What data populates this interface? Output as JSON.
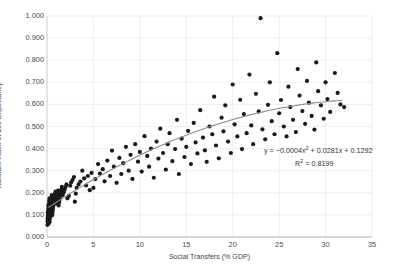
{
  "chart_data": {
    "type": "scatter",
    "title": "",
    "xlabel": "Social Transfers (% GDP)",
    "ylabel": "Kakwani Index of Life Expectancy",
    "xlim": [
      0,
      35
    ],
    "ylim": [
      0.0,
      1.0
    ],
    "xticks": [
      "0",
      "5",
      "10",
      "15",
      "20",
      "25",
      "30",
      "35"
    ],
    "xtick_values": [
      0,
      5,
      10,
      15,
      20,
      25,
      30,
      35
    ],
    "yticks": [
      "0.000",
      "0.100",
      "0.200",
      "0.300",
      "0.400",
      "0.500",
      "0.600",
      "0.700",
      "0.800",
      "0.900",
      "1.000"
    ],
    "ytick_values": [
      0.0,
      0.1,
      0.2,
      0.3,
      0.4,
      0.5,
      0.6,
      0.7,
      0.8,
      0.9,
      1.0
    ],
    "grid": true,
    "grid_color": "#e8e8e8",
    "legend": "none",
    "marker_color": "#1a1a1a",
    "marker_size": 2.1,
    "trendline": {
      "type": "polynomial",
      "degree": 2,
      "color": "#8c8c8c",
      "coefficients": [
        -0.0004,
        0.0281,
        0.1292
      ],
      "x_start": 0.15,
      "x_end": 31.8
    },
    "annotations": [
      {
        "name": "equation",
        "text": "y = −0.0004x² + 0.0281x + 0.1292"
      },
      {
        "name": "r-squared",
        "text": "R² = 0.8199"
      }
    ],
    "equation_parts": {
      "prefix": "y = −0.0004x",
      "exp": "2",
      "suffix": " + 0.0281x + 0.1292",
      "r2_prefix": "R",
      "r2_exp": "2",
      "r2_suffix": " = 0.8199"
    },
    "points": [
      [
        0.05,
        0.055
      ],
      [
        0.06,
        0.071
      ],
      [
        0.07,
        0.083
      ],
      [
        0.08,
        0.095
      ],
      [
        0.09,
        0.104
      ],
      [
        0.1,
        0.112
      ],
      [
        0.11,
        0.063
      ],
      [
        0.12,
        0.077
      ],
      [
        0.13,
        0.09
      ],
      [
        0.14,
        0.12
      ],
      [
        0.15,
        0.131
      ],
      [
        0.16,
        0.144
      ],
      [
        0.17,
        0.06
      ],
      [
        0.18,
        0.086
      ],
      [
        0.19,
        0.099
      ],
      [
        0.2,
        0.107
      ],
      [
        0.21,
        0.117
      ],
      [
        0.22,
        0.126
      ],
      [
        0.23,
        0.135
      ],
      [
        0.24,
        0.15
      ],
      [
        0.25,
        0.158
      ],
      [
        0.26,
        0.166
      ],
      [
        0.27,
        0.175
      ],
      [
        0.28,
        0.068
      ],
      [
        0.3,
        0.081
      ],
      [
        0.32,
        0.092
      ],
      [
        0.34,
        0.101
      ],
      [
        0.36,
        0.11
      ],
      [
        0.38,
        0.122
      ],
      [
        0.4,
        0.133
      ],
      [
        0.42,
        0.141
      ],
      [
        0.44,
        0.153
      ],
      [
        0.46,
        0.163
      ],
      [
        0.48,
        0.172
      ],
      [
        0.5,
        0.181
      ],
      [
        0.52,
        0.19
      ],
      [
        0.55,
        0.098
      ],
      [
        0.58,
        0.108
      ],
      [
        0.6,
        0.119
      ],
      [
        0.63,
        0.128
      ],
      [
        0.66,
        0.138
      ],
      [
        0.7,
        0.147
      ],
      [
        0.73,
        0.157
      ],
      [
        0.76,
        0.168
      ],
      [
        0.8,
        0.178
      ],
      [
        0.84,
        0.188
      ],
      [
        0.88,
        0.196
      ],
      [
        0.92,
        0.205
      ],
      [
        0.96,
        0.152
      ],
      [
        1.0,
        0.163
      ],
      [
        1.05,
        0.174
      ],
      [
        1.1,
        0.186
      ],
      [
        1.15,
        0.198
      ],
      [
        1.2,
        0.21
      ],
      [
        1.25,
        0.143
      ],
      [
        1.3,
        0.156
      ],
      [
        1.35,
        0.168
      ],
      [
        1.4,
        0.181
      ],
      [
        1.45,
        0.193
      ],
      [
        1.5,
        0.205
      ],
      [
        1.55,
        0.216
      ],
      [
        1.6,
        0.227
      ],
      [
        1.7,
        0.19
      ],
      [
        1.8,
        0.202
      ],
      [
        1.9,
        0.214
      ],
      [
        2.0,
        0.226
      ],
      [
        2.1,
        0.238
      ],
      [
        2.2,
        0.175
      ],
      [
        2.35,
        0.186
      ],
      [
        2.5,
        0.232
      ],
      [
        2.6,
        0.247
      ],
      [
        2.75,
        0.258
      ],
      [
        2.9,
        0.271
      ],
      [
        3.0,
        0.16
      ],
      [
        3.1,
        0.196
      ],
      [
        3.2,
        0.222
      ],
      [
        3.4,
        0.238
      ],
      [
        3.6,
        0.251
      ],
      [
        3.8,
        0.3
      ],
      [
        4.0,
        0.265
      ],
      [
        4.2,
        0.233
      ],
      [
        4.4,
        0.276
      ],
      [
        4.6,
        0.212
      ],
      [
        4.8,
        0.29
      ],
      [
        5.0,
        0.222
      ],
      [
        5.2,
        0.262
      ],
      [
        5.5,
        0.33
      ],
      [
        5.7,
        0.287
      ],
      [
        6.0,
        0.307
      ],
      [
        6.2,
        0.252
      ],
      [
        6.5,
        0.346
      ],
      [
        6.8,
        0.276
      ],
      [
        7.0,
        0.391
      ],
      [
        7.2,
        0.318
      ],
      [
        7.5,
        0.245
      ],
      [
        7.8,
        0.358
      ],
      [
        8.0,
        0.285
      ],
      [
        8.2,
        0.334
      ],
      [
        8.5,
        0.408
      ],
      [
        8.8,
        0.3
      ],
      [
        9.0,
        0.372
      ],
      [
        9.2,
        0.263
      ],
      [
        9.5,
        0.42
      ],
      [
        9.8,
        0.341
      ],
      [
        10.0,
        0.385
      ],
      [
        10.2,
        0.296
      ],
      [
        10.5,
        0.456
      ],
      [
        10.8,
        0.367
      ],
      [
        11.0,
        0.318
      ],
      [
        11.2,
        0.4
      ],
      [
        11.5,
        0.268
      ],
      [
        11.8,
        0.432
      ],
      [
        12.0,
        0.355
      ],
      [
        12.2,
        0.49
      ],
      [
        12.5,
        0.38
      ],
      [
        12.8,
        0.305
      ],
      [
        13.0,
        0.42
      ],
      [
        13.2,
        0.47
      ],
      [
        13.5,
        0.343
      ],
      [
        13.8,
        0.398
      ],
      [
        14.0,
        0.53
      ],
      [
        14.2,
        0.285
      ],
      [
        14.5,
        0.445
      ],
      [
        14.8,
        0.362
      ],
      [
        15.0,
        0.408
      ],
      [
        15.2,
        0.48
      ],
      [
        15.5,
        0.33
      ],
      [
        15.8,
        0.516
      ],
      [
        16.0,
        0.428
      ],
      [
        16.2,
        0.378
      ],
      [
        16.5,
        0.574
      ],
      [
        16.8,
        0.45
      ],
      [
        17.0,
        0.392
      ],
      [
        17.2,
        0.34
      ],
      [
        17.5,
        0.5
      ],
      [
        17.8,
        0.465
      ],
      [
        18.0,
        0.635
      ],
      [
        18.2,
        0.414
      ],
      [
        18.5,
        0.356
      ],
      [
        18.8,
        0.54
      ],
      [
        19.0,
        0.478
      ],
      [
        19.2,
        0.596
      ],
      [
        19.5,
        0.432
      ],
      [
        19.8,
        0.38
      ],
      [
        20.0,
        0.69
      ],
      [
        20.2,
        0.51
      ],
      [
        20.5,
        0.455
      ],
      [
        20.8,
        0.621
      ],
      [
        21.0,
        0.398
      ],
      [
        21.2,
        0.556
      ],
      [
        21.5,
        0.47
      ],
      [
        21.8,
        0.735
      ],
      [
        22.0,
        0.505
      ],
      [
        22.2,
        0.42
      ],
      [
        22.5,
        0.648
      ],
      [
        22.8,
        0.568
      ],
      [
        23.0,
        0.99
      ],
      [
        23.2,
        0.487
      ],
      [
        23.5,
        0.442
      ],
      [
        23.8,
        0.598
      ],
      [
        24.0,
        0.7
      ],
      [
        24.2,
        0.524
      ],
      [
        24.5,
        0.465
      ],
      [
        24.8,
        0.832
      ],
      [
        25.0,
        0.56
      ],
      [
        25.2,
        0.62
      ],
      [
        25.5,
        0.5
      ],
      [
        25.8,
        0.455
      ],
      [
        26.0,
        0.68
      ],
      [
        26.2,
        0.588
      ],
      [
        26.5,
        0.53
      ],
      [
        26.8,
        0.475
      ],
      [
        27.0,
        0.76
      ],
      [
        27.2,
        0.64
      ],
      [
        27.5,
        0.57
      ],
      [
        27.8,
        0.512
      ],
      [
        28.0,
        0.706
      ],
      [
        28.2,
        0.608
      ],
      [
        28.5,
        0.548
      ],
      [
        28.8,
        0.486
      ],
      [
        29.0,
        0.79
      ],
      [
        29.2,
        0.66
      ],
      [
        29.5,
        0.596
      ],
      [
        29.8,
        0.535
      ],
      [
        30.0,
        0.7
      ],
      [
        30.2,
        0.624
      ],
      [
        30.5,
        0.566
      ],
      [
        31.0,
        0.742
      ],
      [
        31.3,
        0.652
      ],
      [
        31.6,
        0.6
      ],
      [
        32.0,
        0.588
      ]
    ]
  }
}
